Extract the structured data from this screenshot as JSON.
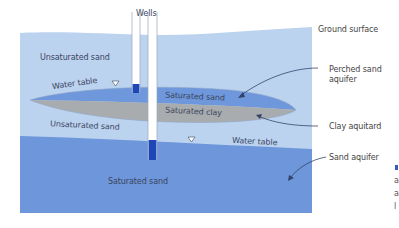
{
  "diagram": {
    "title_wells": "Wells",
    "layers": {
      "upper_unsaturated": "Unsaturated sand",
      "perched_saturated": "Saturated sand",
      "aquitard_clay": "Saturated clay",
      "lower_unsaturated": "Unsaturated sand",
      "lower_saturated": "Saturated sand"
    },
    "water_table_labels": {
      "perched": "Water table",
      "regional": "Water table"
    },
    "callouts": {
      "ground_surface": "Ground surface",
      "perched_aquifer_line1": "Perched sand",
      "perched_aquifer_line2": "aquifer",
      "clay_aquitard": "Clay aquitard",
      "sand_aquifer": "Sand aquifer"
    },
    "edge_fragments": [
      "a",
      "a",
      "l"
    ],
    "colors": {
      "unsaturated": "#bcd3f0",
      "perched_saturated": "#6f97db",
      "clay": "#a9acae",
      "lower_saturated": "#6e96da",
      "well_water": "#1d47b8",
      "well_casing": "#ffffff",
      "arrow": "#33446a"
    }
  }
}
